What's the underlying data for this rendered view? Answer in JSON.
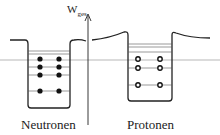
{
  "diagram": {
    "axis_label": "W",
    "axis_label_sub": "ges",
    "wells": [
      {
        "name": "Neutronen",
        "particle": "filled",
        "occupied_levels": 4,
        "particles_per_level": 2
      },
      {
        "name": "Protonen",
        "particle": "open",
        "occupied_levels": 3,
        "particles_per_level": 2
      }
    ],
    "colors": {
      "line": "#222222",
      "fill": "#111111",
      "background": "#ffffff"
    }
  }
}
